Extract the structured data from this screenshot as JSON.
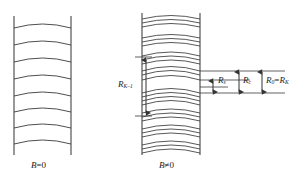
{
  "figure": {
    "title_present": false,
    "background_color": "#ffffff",
    "stroke_color": "#333333",
    "panels": [
      {
        "id": "left-panel",
        "caption": "B=0",
        "caption_parts": {
          "symbol": "B",
          "relation": "=",
          "value": "0"
        },
        "description": "uniform ladder of evenly spaced curved energy levels between two vertical walls",
        "wall_left_x": 14,
        "wall_right_x": 71,
        "wall_top_y": 16,
        "wall_bottom_y": 155,
        "level_count": 8,
        "level_y": [
          28,
          45,
          62,
          79,
          96,
          112,
          128,
          144
        ],
        "arc_sag": 7
      },
      {
        "id": "right-panel",
        "caption": "B≠0",
        "caption_parts": {
          "symbol": "B",
          "relation": "≠",
          "value": "0"
        },
        "description": "split Landau-level groups of closely spaced curved levels between two vertical walls",
        "wall_left_x": 142,
        "wall_right_x": 200,
        "wall_top_y": 13,
        "wall_bottom_y": 155,
        "group_count": 8,
        "group_centers_y": [
          22,
          41,
          59,
          74,
          96,
          113,
          130,
          147
        ],
        "lines_per_group": [
          3,
          3,
          3,
          4,
          4,
          3,
          3,
          3
        ],
        "arc_sag": 7
      }
    ],
    "annotations": [
      {
        "id": "rk-minus-1",
        "label": "R",
        "subscript": "K–1",
        "full_label": "R_{K-1}",
        "type": "double-headed-vertical-arrow",
        "x": 146,
        "y_top": 57,
        "y_bottom": 116,
        "label_x": 122,
        "label_y": 80
      },
      {
        "id": "rs",
        "label": "R",
        "subscript": "s",
        "full_label": "R_s",
        "type": "double-headed-vertical-arrow",
        "x": 213,
        "y_top": 80,
        "y_bottom": 93,
        "label_x": 218,
        "label_y": 81
      },
      {
        "id": "rc",
        "label": "R",
        "subscript": "c",
        "full_label": "R_c",
        "type": "double-headed-vertical-arrow",
        "x": 239,
        "y_top": 71,
        "y_bottom": 93,
        "label_x": 243,
        "label_y": 80
      },
      {
        "id": "r0-equals-rk",
        "label": "R",
        "subscript": "0",
        "relation": "=",
        "label2": "R",
        "subscript2": "K",
        "full_label": "R_0 = R_K",
        "type": "double-headed-vertical-arrow",
        "x": 262,
        "y_top": 71,
        "y_bottom": 93,
        "label_x": 266,
        "label_y": 80
      }
    ],
    "leader_lines": [
      {
        "id": "leader-upper-a",
        "x1": 200,
        "y1": 71,
        "x2": 285,
        "y2": 71
      },
      {
        "id": "leader-upper-b",
        "x1": 200,
        "y1": 80,
        "x2": 252,
        "y2": 80
      },
      {
        "id": "leader-lower-a",
        "x1": 200,
        "y1": 93,
        "x2": 285,
        "y2": 93
      },
      {
        "id": "leader-mid",
        "x1": 200,
        "y1": 87,
        "x2": 228,
        "y2": 87
      }
    ]
  }
}
